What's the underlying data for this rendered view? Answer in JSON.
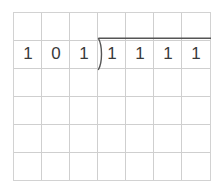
{
  "worksheet": {
    "title": "binary long division worksheet",
    "background_color": "#ffffff",
    "grid": {
      "columns": 7,
      "rows": 6,
      "cell_width": 28,
      "cell_height": 28,
      "line_color": "#cfcfcf",
      "border_color": "#d2d2d2"
    },
    "problem": {
      "type": "long-division",
      "divisor_label": "101",
      "dividend_label": "1111",
      "divisor_digits": [
        "1",
        "0",
        "1"
      ],
      "dividend_digits": [
        "1",
        "1",
        "1",
        "1"
      ],
      "digit_color": "#3a3a3a",
      "sign_color": "#555555",
      "row_index": 1
    }
  }
}
